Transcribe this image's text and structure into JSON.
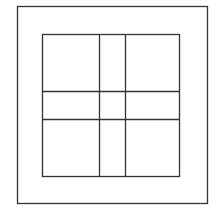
{
  "diagram": {
    "stroke_color": "#333333",
    "background": "#ffffff",
    "outer_square": {
      "x": 17,
      "y": 6,
      "width": 190,
      "height": 197
    },
    "inner_square": {
      "x": 42,
      "y": 34,
      "width": 137,
      "height": 142
    },
    "vertical_lines_x": [
      99,
      125
    ],
    "horizontal_lines_y": [
      91,
      119
    ]
  }
}
